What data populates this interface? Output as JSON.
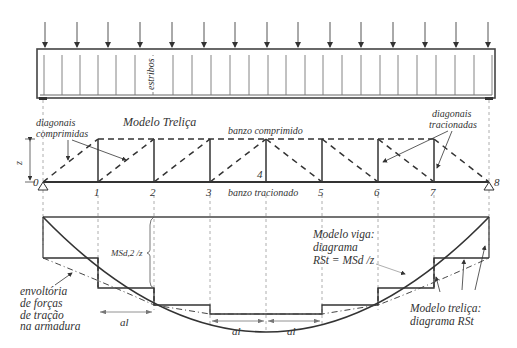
{
  "beam": {
    "stirrups_label": "estribos",
    "load_arrow_x": [
      45,
      77,
      108,
      140,
      172,
      204,
      235,
      267,
      298,
      330,
      361,
      393,
      425,
      456,
      488
    ],
    "stirrup_x": [
      44,
      62,
      80,
      98,
      116,
      135,
      153,
      173,
      192,
      211,
      230,
      249,
      268,
      286,
      305,
      323,
      342,
      361,
      380,
      398,
      417,
      436,
      455,
      474,
      492
    ]
  },
  "truss": {
    "title": "Modelo Treliça",
    "top_chord_label": "banzo comprimido",
    "bottom_chord_label": "banzo tracionado",
    "compressed_diagonals_label_1": "diagonais",
    "compressed_diagonals_label_2": "comprimidas",
    "tension_diagonals_label_1": "diagonais",
    "tension_diagonals_label_2": "tracionadas",
    "lever_arm_label": "z",
    "node_labels": [
      "0",
      "1",
      "2",
      "3",
      "4",
      "5",
      "6",
      "7",
      "8"
    ],
    "node_x": [
      43,
      98,
      154,
      210,
      266,
      322,
      378,
      434,
      489
    ]
  },
  "diagram": {
    "force_label": "MSd,2 /z",
    "envelope_label_1": "envoltória",
    "envelope_label_2": "de forças",
    "envelope_label_3": "de tração",
    "envelope_label_4": "na armadura",
    "beam_model_label_1": "Modelo viga:",
    "beam_model_label_2": "diagrama",
    "beam_model_label_3": "RSt = MSd /z",
    "truss_model_label_1": "Modelo treliça:",
    "truss_model_label_2": "diagrama RSt",
    "shift_label": "al"
  }
}
